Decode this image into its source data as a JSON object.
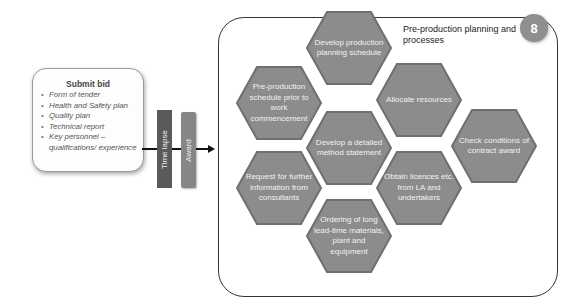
{
  "bid": {
    "title": "Submit bid",
    "items": [
      "Form of tender",
      "Health and Safety plan",
      "Quality plan",
      "Technical report",
      "Key personnel – qualifications/ experience"
    ]
  },
  "bars": {
    "time_lapse": "Time lapse",
    "award": "Award"
  },
  "panel": {
    "title": "Pre-production planning and processes",
    "badge": "8",
    "hexagons": [
      {
        "label": "Develop production planning schedule"
      },
      {
        "label": "Pre-production schedule prior to work commencement"
      },
      {
        "label": "Allocate resources"
      },
      {
        "label": "Develop a detailed method statement"
      },
      {
        "label": "Check conditions of contract award"
      },
      {
        "label": "Request for further information from consultants"
      },
      {
        "label": "Obtain licences etc. from LA and undertakers"
      },
      {
        "label": "Ordering of long lead-time materials, plant and equipment"
      }
    ]
  },
  "colors": {
    "hex_fill": "#8c8c8c",
    "hex_edge": "#6f6f6f",
    "bar_dark": "#5a5a5a",
    "bar_light": "#868686",
    "badge": "#8f8f8f"
  }
}
